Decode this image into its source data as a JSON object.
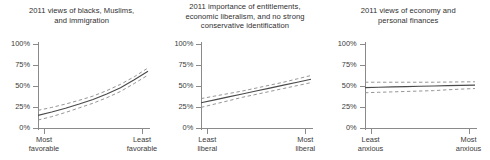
{
  "figure": {
    "background": "#ffffff",
    "mean_color": "#4a4a4a",
    "ci_color": "#8f8f8f",
    "axis_color": "#8a8a8a"
  },
  "panels": [
    {
      "title": "2011 views of blacks, Muslims,\nand immigration",
      "x_left_label": "Most\nfavorable",
      "x_right_label": "Least\nfavorable",
      "y_ticks": [
        "100%",
        "75%",
        "50%",
        "25%",
        "0%"
      ]
    },
    {
      "title": "2011 importance of entitlements,\neconomic liberalism, and no strong\nconservative identification",
      "x_left_label": "Least\nliberal",
      "x_right_label": "Most\nliberal",
      "y_ticks": [
        "100%",
        "75%",
        "50%",
        "25%",
        "0%"
      ]
    },
    {
      "title": "2011 views of economy and\npersonal finances",
      "x_left_label": "Least\nanxious",
      "x_right_label": "Most\nanxious",
      "y_ticks": [
        "100%",
        "75%",
        "50%",
        "25%",
        "0%"
      ]
    }
  ],
  "chart_data": [
    {
      "type": "line",
      "title": "2011 views of blacks, Muslims, and immigration",
      "xlabel": "",
      "ylabel": "",
      "xlim": [
        0,
        1
      ],
      "ylim": [
        0,
        100
      ],
      "ytick_values": [
        0,
        25,
        50,
        75,
        100
      ],
      "ytick_labels": [
        "0%",
        "25%",
        "50%",
        "75%",
        "100%"
      ],
      "xtick_values": [
        0,
        1
      ],
      "xtick_labels": [
        "Most favorable",
        "Least favorable"
      ],
      "grid": false,
      "legend": "none",
      "x": [
        0,
        0.125,
        0.25,
        0.375,
        0.5,
        0.625,
        0.75,
        0.875,
        1
      ],
      "series": [
        {
          "name": "predicted probability",
          "style": "solid",
          "values": [
            15.0,
            19.0,
            23.5,
            28.5,
            34.0,
            40.5,
            48.0,
            57.5,
            67.5
          ]
        },
        {
          "name": "upper 95% CI",
          "style": "dashed",
          "values": [
            21.0,
            24.5,
            28.5,
            33.0,
            38.0,
            44.5,
            52.0,
            61.0,
            71.5
          ]
        },
        {
          "name": "lower 95% CI",
          "style": "dashed",
          "values": [
            9.5,
            13.5,
            18.5,
            24.0,
            29.5,
            36.0,
            43.5,
            53.0,
            63.0
          ]
        }
      ]
    },
    {
      "type": "line",
      "title": "2011 importance of entitlements, economic liberalism, and no strong conservative identification",
      "xlabel": "",
      "ylabel": "",
      "xlim": [
        0,
        1
      ],
      "ylim": [
        0,
        100
      ],
      "ytick_values": [
        0,
        25,
        50,
        75,
        100
      ],
      "ytick_labels": [
        "0%",
        "25%",
        "50%",
        "75%",
        "100%"
      ],
      "xtick_values": [
        0,
        1
      ],
      "xtick_labels": [
        "Least liberal",
        "Most liberal"
      ],
      "grid": false,
      "legend": "none",
      "x": [
        0,
        0.125,
        0.25,
        0.375,
        0.5,
        0.625,
        0.75,
        0.875,
        1
      ],
      "series": [
        {
          "name": "predicted probability",
          "style": "solid",
          "values": [
            30.0,
            33.5,
            37.0,
            40.5,
            44.0,
            47.5,
            51.0,
            54.5,
            58.0
          ]
        },
        {
          "name": "upper 95% CI",
          "style": "dashed",
          "values": [
            35.0,
            38.0,
            41.0,
            44.0,
            47.5,
            51.0,
            54.5,
            58.5,
            62.5
          ]
        },
        {
          "name": "lower 95% CI",
          "style": "dashed",
          "values": [
            24.5,
            28.5,
            32.5,
            36.5,
            40.0,
            43.5,
            47.0,
            50.5,
            54.0
          ]
        }
      ]
    },
    {
      "type": "line",
      "title": "2011 views of economy and personal finances",
      "xlabel": "",
      "ylabel": "",
      "xlim": [
        0,
        1
      ],
      "ylim": [
        0,
        100
      ],
      "ytick_values": [
        0,
        25,
        50,
        75,
        100
      ],
      "ytick_labels": [
        "0%",
        "25%",
        "50%",
        "75%",
        "100%"
      ],
      "xtick_values": [
        0,
        1
      ],
      "xtick_labels": [
        "Least anxious",
        "Most anxious"
      ],
      "grid": false,
      "legend": "none",
      "x": [
        0,
        0.125,
        0.25,
        0.375,
        0.5,
        0.625,
        0.75,
        0.875,
        1
      ],
      "series": [
        {
          "name": "predicted probability",
          "style": "solid",
          "values": [
            48.0,
            48.5,
            49.0,
            49.3,
            49.7,
            50.0,
            50.4,
            50.7,
            51.0
          ]
        },
        {
          "name": "upper 95% CI",
          "style": "dashed",
          "values": [
            54.5,
            54.5,
            54.5,
            54.5,
            54.5,
            54.5,
            54.7,
            54.9,
            55.0
          ]
        },
        {
          "name": "lower 95% CI",
          "style": "dashed",
          "values": [
            42.0,
            42.5,
            43.0,
            43.5,
            44.0,
            44.5,
            45.5,
            46.3,
            47.0
          ]
        }
      ]
    }
  ]
}
